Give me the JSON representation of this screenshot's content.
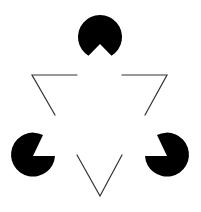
{
  "figure": {
    "background": "#ffffff",
    "fill_color": "#000000",
    "line_color": "#333333",
    "pacmen": [
      {
        "name": "top",
        "cx": 100,
        "cy": 37,
        "r": 22,
        "notch_direction": "down"
      },
      {
        "name": "bottom-left",
        "cx": 33,
        "cy": 156,
        "r": 22,
        "notch_direction": "upper-right"
      },
      {
        "name": "bottom-right",
        "cx": 167,
        "cy": 156,
        "r": 22,
        "notch_direction": "upper-left"
      }
    ],
    "outline_triangle": {
      "vertices": [
        [
          32,
          75
        ],
        [
          167,
          75
        ],
        [
          100,
          196
        ]
      ],
      "orientation": "inverted"
    }
  }
}
